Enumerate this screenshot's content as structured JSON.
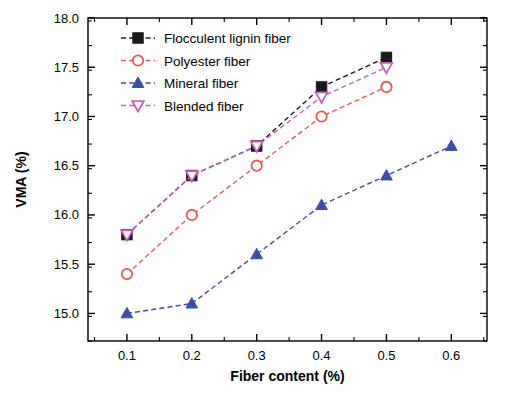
{
  "chart_data": {
    "type": "line",
    "title": "",
    "xlabel": "Fiber content (%)",
    "ylabel": "VMA (%)",
    "xlim": [
      0.04,
      0.655
    ],
    "ylim": [
      14.72,
      18.0
    ],
    "xticks": [
      "0.1",
      "0.2",
      "0.3",
      "0.4",
      "0.5",
      "0.6"
    ],
    "xtick_values": [
      0.1,
      0.2,
      0.3,
      0.4,
      0.5,
      0.6
    ],
    "yticks": [
      "15.0",
      "15.5",
      "16.0",
      "16.5",
      "17.0",
      "17.5",
      "18.0"
    ],
    "ytick_values": [
      15.0,
      15.5,
      16.0,
      16.5,
      17.0,
      17.5,
      18.0
    ],
    "grid": false,
    "legend_position": "top-left-inside",
    "series": [
      {
        "name": "Flocculent lignin fiber",
        "color": "#1a1a1a",
        "marker": "square",
        "x": [
          0.1,
          0.2,
          0.3,
          0.4,
          0.5
        ],
        "values": [
          15.8,
          16.4,
          16.7,
          17.3,
          17.6
        ]
      },
      {
        "name": "Polyester fiber",
        "color": "#e8584f",
        "marker": "circle",
        "x": [
          0.1,
          0.2,
          0.3,
          0.4,
          0.5
        ],
        "values": [
          15.4,
          16.0,
          16.5,
          17.0,
          17.3
        ]
      },
      {
        "name": "Mineral fiber",
        "color": "#3d4fa1",
        "marker": "triangle-up",
        "x": [
          0.1,
          0.2,
          0.3,
          0.4,
          0.5,
          0.6
        ],
        "values": [
          15.0,
          15.1,
          15.6,
          16.1,
          16.4,
          16.7
        ]
      },
      {
        "name": "Blended fiber",
        "color": "#c75fc0",
        "marker": "triangle-down",
        "x": [
          0.1,
          0.2,
          0.3,
          0.4,
          0.5
        ],
        "values": [
          15.8,
          16.4,
          16.7,
          17.2,
          17.5
        ]
      }
    ]
  }
}
